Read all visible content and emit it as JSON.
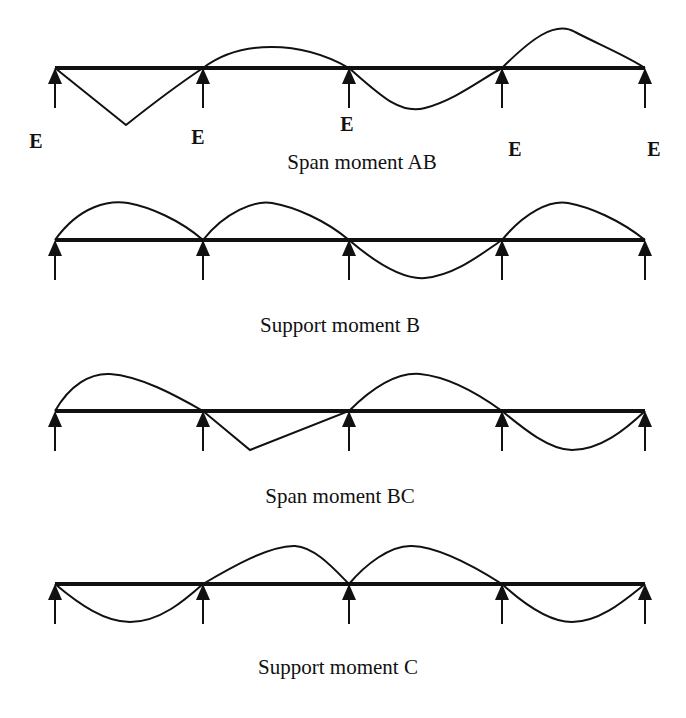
{
  "supports_x": [
    55,
    203,
    349,
    502,
    645
  ],
  "colors": {
    "line": "#111111",
    "background": "#ffffff"
  },
  "diagrams": [
    {
      "id": "span-moment-ab",
      "caption": "Span moment AB",
      "beam_y": 68,
      "support_labels": [
        "E",
        "E",
        "E",
        "E",
        "E"
      ],
      "curve_shape": [
        "down-triangle",
        "up",
        "down",
        "up"
      ]
    },
    {
      "id": "support-moment-b",
      "caption": "Support moment B",
      "beam_y": 240,
      "curve_shape": [
        "up",
        "up",
        "down",
        "up"
      ]
    },
    {
      "id": "span-moment-bc",
      "caption": "Span moment BC",
      "beam_y": 411,
      "curve_shape": [
        "up",
        "down-triangle",
        "up",
        "down"
      ]
    },
    {
      "id": "support-moment-c",
      "caption": "Support moment C",
      "beam_y": 584,
      "curve_shape": [
        "down",
        "up",
        "up",
        "down"
      ]
    }
  ]
}
